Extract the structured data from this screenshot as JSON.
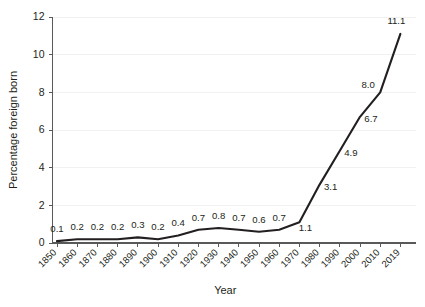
{
  "chart_data": {
    "type": "line",
    "title": "",
    "xlabel": "Year",
    "ylabel": "Percentage foreign born",
    "categories": [
      "1850",
      "1860",
      "1870",
      "1880",
      "1890",
      "1900",
      "1910",
      "1920",
      "1930",
      "1940",
      "1950",
      "1960",
      "1970",
      "1980",
      "1990",
      "2000",
      "2010",
      "2019"
    ],
    "values": [
      0.1,
      0.2,
      0.2,
      0.2,
      0.3,
      0.2,
      0.4,
      0.7,
      0.8,
      0.7,
      0.6,
      0.7,
      1.1,
      3.1,
      4.9,
      6.7,
      8.0,
      11.1
    ],
    "value_labels": [
      "0.1",
      "0.2",
      "0.2",
      "0.2",
      "0.3",
      "0.2",
      "0.4",
      "0.7",
      "0.8",
      "0.7",
      "0.6",
      "0.7",
      "1.1",
      "3.1",
      "4.9",
      "6.7",
      "8.0",
      "11.1"
    ],
    "ylim": [
      0,
      12
    ],
    "yticks": [
      0,
      2,
      4,
      6,
      8,
      10,
      12
    ],
    "ytick_labels": [
      "0",
      "2",
      "4",
      "6",
      "8",
      "10",
      "12"
    ],
    "grid": true,
    "grid_axis": "y",
    "legend": "none",
    "line_color": "#231f20",
    "grid_color": "#f1f1f2",
    "axis_color": "#58595b",
    "text_color": "#231f20",
    "xtick_rotation": 45
  }
}
